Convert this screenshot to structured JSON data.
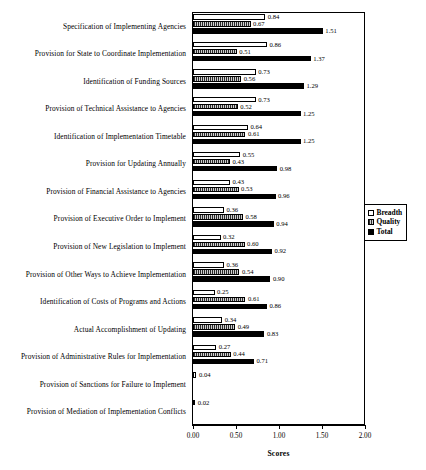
{
  "chart_data": {
    "type": "bar",
    "orientation": "horizontal",
    "title": "",
    "xlabel": "Scores",
    "ylabel": "",
    "xlim": [
      0.0,
      2.0
    ],
    "xticks": [
      "0.00",
      "0.50",
      "1.00",
      "1.50",
      "2.00"
    ],
    "xtick_values": [
      0.0,
      0.5,
      1.0,
      1.5,
      2.0
    ],
    "grid": false,
    "legend_position": "right",
    "data_labels": true,
    "categories": [
      "Specification of Implementing Agencies",
      "Provision for State to Coordinate Implementation",
      "Identification of Funding Sources",
      "Provision of Technical Assistance to Agencies",
      "Identification of Implementation Timetable",
      "Provision for Updating Annually",
      "Provision of Financial Assistance to Agencies",
      "Provision of Executive Order to Implement",
      "Provision of New Legislation to Implement",
      "Provision of Other Ways to Achieve Implementation",
      "Identification of Costs of Programs and Actions",
      "Actual Accomplishment of Updating",
      "Provision of Administrative Rules for Implementation",
      "Provision of Sanctions for Failure to Implement",
      "Provision of Mediation of Implementation Conflicts"
    ],
    "series": [
      {
        "name": "Breadth",
        "color": "#ffffff",
        "values": [
          0.84,
          0.86,
          0.73,
          0.73,
          0.64,
          0.55,
          0.43,
          0.36,
          0.32,
          0.36,
          0.25,
          0.34,
          0.27,
          0.04,
          0.02
        ],
        "labels": [
          "0.84",
          "0.86",
          "0.73",
          "0.73",
          "0.64",
          "0.55",
          "0.43",
          "0.36",
          "0.32",
          "0.36",
          "0.25",
          "0.34",
          "0.27",
          "0.04",
          "0.02"
        ]
      },
      {
        "name": "Quality",
        "color": "#8d8d8d",
        "values": [
          0.67,
          0.51,
          0.56,
          0.52,
          0.61,
          0.43,
          0.53,
          0.58,
          0.6,
          0.54,
          0.61,
          0.49,
          0.44,
          null,
          null
        ],
        "labels": [
          "0.67",
          "0.51",
          "0.56",
          "0.52",
          "0.61",
          "0.43",
          "0.53",
          "0.58",
          "0.60",
          "0.54",
          "0.61",
          "0.49",
          "0.44",
          "",
          ""
        ]
      },
      {
        "name": "Total",
        "color": "#000000",
        "values": [
          1.51,
          1.37,
          1.29,
          1.25,
          1.25,
          0.98,
          0.96,
          0.94,
          0.92,
          0.9,
          0.86,
          0.83,
          0.71,
          null,
          null
        ],
        "labels": [
          "1.51",
          "1.37",
          "1.29",
          "1.25",
          "1.25",
          "0.98",
          "0.96",
          "0.94",
          "0.92",
          "0.90",
          "0.86",
          "0.83",
          "0.71",
          "",
          ""
        ]
      }
    ]
  },
  "legend": {
    "items": [
      {
        "label": "Breadth"
      },
      {
        "label": "Quality"
      },
      {
        "label": "Total"
      }
    ]
  },
  "axis": {
    "x_title": "Scores"
  }
}
